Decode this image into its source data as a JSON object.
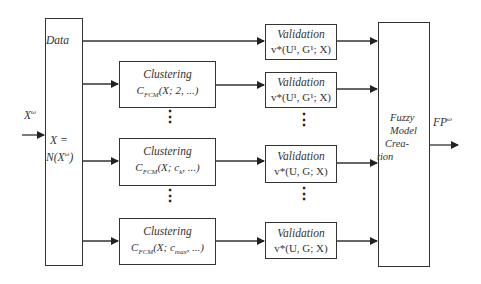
{
  "diagram": {
    "input": {
      "label": "X",
      "sup": "ω"
    },
    "normalization": {
      "data_label": "Data",
      "line1": "X =",
      "line2_pre": "N(X",
      "line2_sup": "ω",
      "line2_post": ")"
    },
    "clustering": [
      {
        "title": "Clustering",
        "fn": "C",
        "sub": "FCM",
        "args": "(X; 2, ...)"
      },
      {
        "title": "Clustering",
        "fn": "C",
        "sub": "FCM",
        "args": "(X; c",
        "argsub": "k",
        "argsend": ", ...)"
      },
      {
        "title": "Clustering",
        "fn": "C",
        "sub": "FCM",
        "args": "(X; c",
        "argsub": "max",
        "argsend": ", ...)"
      }
    ],
    "validation": [
      {
        "title": "Validation",
        "formula": "v*(U¹, G¹; X)"
      },
      {
        "title": "Validation",
        "formula": "v*(U¹, G¹; X)"
      },
      {
        "title": "Validation",
        "formula": "v*(U, G; X)"
      },
      {
        "title": "Validation",
        "formula": "v*(U, G; X)"
      }
    ],
    "fuzzy": {
      "lines": [
        "Fuzzy",
        "Model",
        "Crea-",
        "tion"
      ]
    },
    "output": {
      "label": "FP",
      "sup": "ω"
    },
    "ellipsis": "⋮",
    "colors": {
      "stroke": "#333333",
      "background": "#ffffff"
    }
  }
}
